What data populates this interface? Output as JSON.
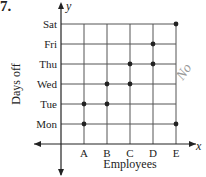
{
  "problem_number": "7.",
  "annotation": "No",
  "chart_data": {
    "type": "scatter",
    "title": "",
    "xlabel": "Employees",
    "ylabel": "Days off",
    "x_axis_var": "x",
    "y_axis_var": "y",
    "categories_x": [
      "A",
      "B",
      "C",
      "D",
      "E"
    ],
    "categories_y": [
      "Mon",
      "Tue",
      "Wed",
      "Thu",
      "Fri",
      "Sat"
    ],
    "grid": true,
    "points": [
      {
        "x": "A",
        "y": "Mon"
      },
      {
        "x": "A",
        "y": "Tue"
      },
      {
        "x": "B",
        "y": "Tue"
      },
      {
        "x": "B",
        "y": "Wed"
      },
      {
        "x": "C",
        "y": "Wed"
      },
      {
        "x": "C",
        "y": "Thu"
      },
      {
        "x": "D",
        "y": "Thu"
      },
      {
        "x": "D",
        "y": "Fri"
      },
      {
        "x": "E",
        "y": "Mon"
      },
      {
        "x": "E",
        "y": "Sat"
      }
    ]
  },
  "colors": {
    "ink": "#222222",
    "grid": "#555555",
    "scribble": "#9a9a9a"
  }
}
